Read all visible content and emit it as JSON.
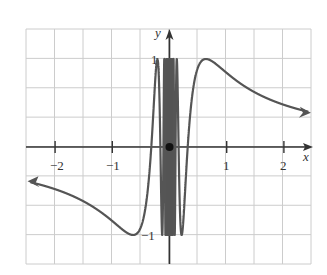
{
  "chart_data": {
    "type": "line",
    "function": "y = sin(1/x)",
    "title": "",
    "xlabel": "x",
    "ylabel": "y",
    "xlim": [
      -2.5,
      2.5
    ],
    "ylim": [
      -1.35,
      1.35
    ],
    "x_ticks": [
      -2,
      -1,
      1,
      2
    ],
    "x_tick_labels": [
      "−2",
      "−1",
      "1",
      "2"
    ],
    "y_tick_labels": [
      "1",
      "−1"
    ],
    "y_ticks": [
      1,
      -1
    ],
    "grid": true,
    "legend": null,
    "annotations": [
      {
        "type": "point",
        "x": 0,
        "y": 0,
        "style": "filled"
      },
      {
        "type": "arrow",
        "where": "left end, x→−∞"
      },
      {
        "type": "arrow",
        "where": "right end, x→+∞"
      }
    ],
    "series": [
      {
        "name": "sin(1/x)",
        "color": "#555555",
        "x": [
          -2.5,
          -2,
          -1.5,
          -1,
          -0.637,
          -0.4,
          -0.318,
          -0.25,
          -0.212,
          -0.15,
          0.15,
          0.212,
          0.25,
          0.318,
          0.4,
          0.637,
          1,
          1.5,
          2,
          2.5
        ],
        "y": [
          -0.39,
          -0.48,
          -0.62,
          -0.84,
          -1.0,
          -0.6,
          0.0,
          0.76,
          1.0,
          0.0,
          0.0,
          -1.0,
          -0.76,
          0.0,
          0.6,
          1.0,
          0.84,
          0.62,
          0.48,
          0.39
        ]
      }
    ]
  },
  "labels": {
    "x_axis": "x",
    "y_axis": "y",
    "x_neg2": "−2",
    "x_neg1": "−1",
    "x_pos1": "1",
    "x_pos2": "2",
    "y_pos1": "1",
    "y_neg1": "−1"
  },
  "colors": {
    "grid": "#cccccc",
    "axis": "#333333",
    "curve": "#555555"
  }
}
